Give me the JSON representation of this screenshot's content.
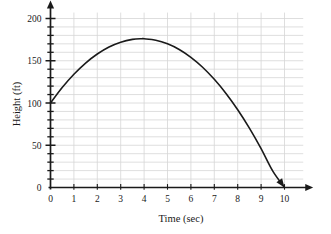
{
  "chart_data": {
    "type": "line",
    "title": "",
    "subtitle": "",
    "xlabel": "Time (sec)",
    "ylabel": "Height (ft)",
    "xlim": [
      0,
      10.8
    ],
    "ylim": [
      0,
      207
    ],
    "grid": true,
    "legend": "none",
    "x_major_ticks": [
      0,
      1,
      2,
      3,
      4,
      5,
      6,
      7,
      8,
      9,
      10
    ],
    "x_tick_labels": [
      "0",
      "1",
      "2",
      "3",
      "4",
      "5",
      "6",
      "7",
      "8",
      "9",
      "10"
    ],
    "y_major_ticks": [
      0,
      50,
      100,
      150,
      200
    ],
    "y_tick_labels": [
      "0",
      "50",
      "100",
      "150",
      "200"
    ],
    "y_minor_tick_step": 10,
    "x_gridline_step": 1,
    "y_gridline_step": 10,
    "annotations": [
      "curve ends with arrowhead at (10, 0)",
      "x-axis ends with arrowhead",
      "y-axis ends with arrowhead"
    ],
    "series": [
      {
        "name": "Height of object",
        "equation": "h = -5t^2 + 39t + 100",
        "color": "#1a1a1a",
        "line_width": 1.6,
        "x": [
          0,
          0.5,
          1,
          1.5,
          2,
          2.5,
          3,
          3.5,
          3.9,
          4,
          4.5,
          5,
          5.5,
          6,
          6.5,
          7,
          7.5,
          8,
          8.5,
          9,
          9.5,
          10
        ],
        "values": [
          100,
          118.3,
          134,
          147.3,
          158,
          166.3,
          172,
          175.3,
          176.1,
          176,
          174.3,
          170,
          163.3,
          154,
          142.3,
          128,
          111.3,
          92,
          70.3,
          46,
          19.3,
          0
        ],
        "start_point": [
          0,
          100
        ],
        "vertex": [
          3.9,
          180
        ],
        "end_point": [
          10,
          0
        ]
      }
    ],
    "colors": {
      "axis": "#1a1a1a",
      "grid": "#d6d6d6",
      "curve": "#1a1a1a",
      "background": "#ffffff",
      "text": "#1a1a1a"
    }
  }
}
